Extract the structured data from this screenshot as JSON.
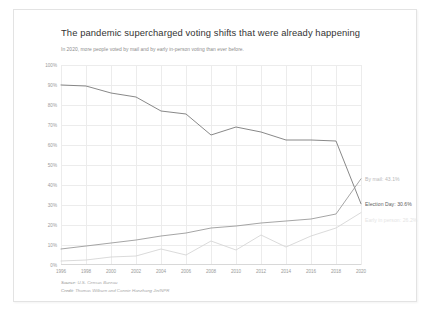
{
  "header": {
    "title": "The pandemic supercharged voting shifts that were already happening",
    "subtitle": "In 2020, more people voted by mail and by early in-person voting than ever before."
  },
  "footer": {
    "source_lead": "Source:",
    "source_value": "U.S. Census Bureau",
    "credit_lead": "Credit:",
    "credit_value": "Thomas Wilburn and Connie Hanzhang Jin/NPR"
  },
  "annotations": {
    "by_mail": "By mail: 43.1%",
    "election_day": "Election Day: 30.6%",
    "early_in_person": "Early in person: 26.2%"
  },
  "chart_data": {
    "type": "line",
    "title": "The pandemic supercharged voting shifts that were already happening",
    "subtitle": "In 2020, more people voted by mail and by early in-person voting than ever before.",
    "xlabel": "",
    "ylabel": "",
    "x": [
      1996,
      1998,
      2000,
      2002,
      2004,
      2006,
      2008,
      2010,
      2012,
      2014,
      2016,
      2018,
      2020
    ],
    "categories": [
      "1996",
      "1998",
      "2000",
      "2002",
      "2004",
      "2006",
      "2008",
      "2010",
      "2012",
      "2014",
      "2016",
      "2018",
      "2020"
    ],
    "xlim": [
      1996,
      2020
    ],
    "ylim": [
      0,
      100
    ],
    "ytick_labels": [
      "0%",
      "10%",
      "20%",
      "30%",
      "40%",
      "50%",
      "60%",
      "70%",
      "80%",
      "90%",
      "100%"
    ],
    "ytick_values": [
      0,
      10,
      20,
      30,
      40,
      50,
      60,
      70,
      80,
      90,
      100
    ],
    "grid": true,
    "legend": "none",
    "series": [
      {
        "name": "Election Day",
        "color": "#7a7a7a",
        "values": [
          90.0,
          89.5,
          86.0,
          84.0,
          77.0,
          75.5,
          65.0,
          69.0,
          66.5,
          62.5,
          62.5,
          62.0,
          30.6
        ]
      },
      {
        "name": "By mail",
        "color": "#9b9b9b",
        "values": [
          8.0,
          9.5,
          11.0,
          12.5,
          14.5,
          16.0,
          18.5,
          19.5,
          21.0,
          22.0,
          23.0,
          25.5,
          43.1
        ]
      },
      {
        "name": "Early in person",
        "color": "#d6d6d6",
        "values": [
          2.0,
          2.5,
          4.0,
          4.5,
          8.0,
          5.0,
          12.0,
          7.5,
          15.0,
          9.0,
          14.5,
          18.5,
          26.2
        ]
      }
    ]
  }
}
